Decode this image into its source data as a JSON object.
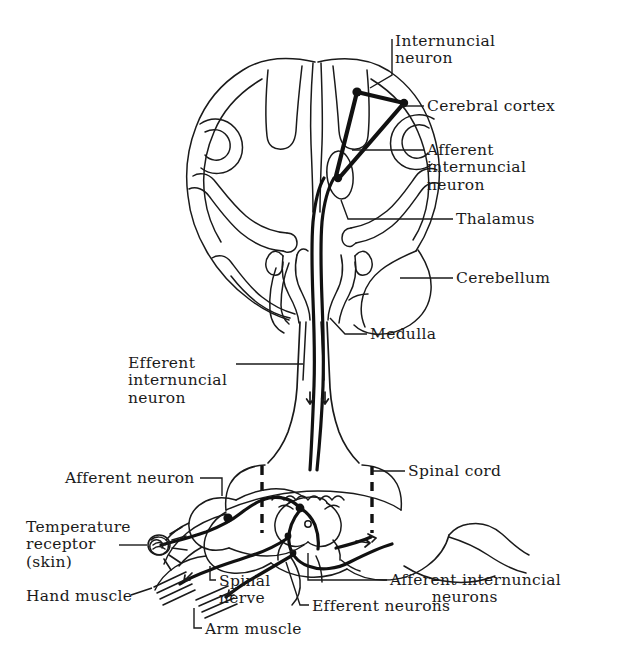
{
  "figure": {
    "kind": "anatomical-line-diagram",
    "background_color": "#ffffff",
    "ink_color": "#1a1a1a",
    "width": 629,
    "height": 659
  },
  "labels": {
    "internuncial_neuron": "Internuncial\nneuron",
    "cerebral_cortex": "Cerebral cortex",
    "afferent_internuncial_neuron": "Afferent\ninternuncial\nneuron",
    "thalamus": "Thalamus",
    "cerebellum": "Cerebellum",
    "medulla": "Medulla",
    "efferent_internuncial_neuron": "Efferent\ninternuncial\nneuron",
    "spinal_cord": "Spinal cord",
    "afferent_neuron": "Afferent neuron",
    "temperature_receptor": "Temperature\nreceptor\n(skin)",
    "hand_muscle": "Hand muscle",
    "spinal_nerve": "Spinal\nnerve",
    "arm_muscle": "Arm muscle",
    "efferent_neurons": "Efferent neurons",
    "afferent_internuncial_neurons": "Afferent internuncial\n        neurons"
  },
  "structures": [
    "cerebral hemispheres (coronal section with gyri and sulci)",
    "thalamus",
    "cerebellum",
    "medulla",
    "brainstem",
    "spinal cord cross-section with grey matter butterfly",
    "spinal nerve",
    "dorsal root ganglion",
    "temperature receptor in skin",
    "hand muscle",
    "arm muscle"
  ],
  "neuron_tracts": [
    "afferent neuron from temperature receptor to spinal cord",
    "afferent internuncial neuron ascending to thalamus",
    "internuncial neuron within cerebral cortex",
    "efferent internuncial neuron descending through medulla",
    "efferent neurons to hand muscle and arm muscle"
  ]
}
